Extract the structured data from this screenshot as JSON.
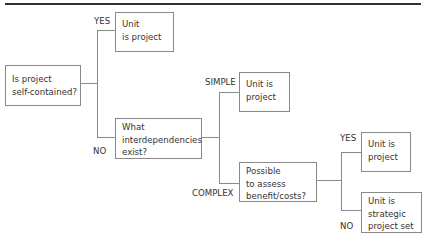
{
  "diagram": {
    "type": "decision-tree",
    "nodes": {
      "root": {
        "text": "Is project self-contained?",
        "line1": "Is project",
        "line2": "self-contained?"
      },
      "yes_unit": {
        "line1": "Unit",
        "line2": "is project"
      },
      "interdep": {
        "line1": "What",
        "line2": "interdependencies",
        "line3": "exist?"
      },
      "simple_unit": {
        "line1": "Unit is",
        "line2": "project"
      },
      "assess": {
        "line1": "Possible",
        "line2": "to assess",
        "line3": "benefit/costs?"
      },
      "yes_unit2": {
        "line1": "Unit is",
        "line2": "project"
      },
      "strategic": {
        "line1": "Unit is",
        "line2": "strategic",
        "line3": "project set"
      }
    },
    "edge_labels": {
      "root_yes": "YES",
      "root_no": "NO",
      "simple": "SIMPLE",
      "complex": "COMPLEX",
      "assess_yes": "YES",
      "assess_no": "NO"
    }
  }
}
